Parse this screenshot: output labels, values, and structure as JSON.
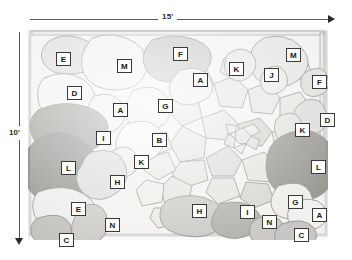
{
  "drawing": {
    "title": "Flagstone patio plan",
    "dimensions": {
      "width_label": "15'",
      "height_label": "10'"
    },
    "colors": {
      "ink": "#3a3a3a",
      "paper": "#ffffff",
      "stone_light": "#f0efed",
      "stone_mid": "#dcdbd7",
      "stone_dark": "#9a9a96",
      "stone_darkest": "#8c8b86",
      "label_fill": "#fdfdfb"
    },
    "plant_labels": [
      {
        "text": "E",
        "x": 56,
        "y": 52
      },
      {
        "text": "M",
        "x": 117,
        "y": 59
      },
      {
        "text": "F",
        "x": 173,
        "y": 47
      },
      {
        "text": "K",
        "x": 229,
        "y": 62
      },
      {
        "text": "J",
        "x": 264,
        "y": 68
      },
      {
        "text": "M",
        "x": 286,
        "y": 48
      },
      {
        "text": "D",
        "x": 67,
        "y": 86
      },
      {
        "text": "A",
        "x": 193,
        "y": 73
      },
      {
        "text": "F",
        "x": 312,
        "y": 75
      },
      {
        "text": "A",
        "x": 113,
        "y": 103
      },
      {
        "text": "G",
        "x": 158,
        "y": 99
      },
      {
        "text": "D",
        "x": 320,
        "y": 113
      },
      {
        "text": "K",
        "x": 295,
        "y": 123
      },
      {
        "text": "I",
        "x": 96,
        "y": 131
      },
      {
        "text": "B",
        "x": 152,
        "y": 133
      },
      {
        "text": "L",
        "x": 61,
        "y": 161
      },
      {
        "text": "K",
        "x": 134,
        "y": 155
      },
      {
        "text": "L",
        "x": 311,
        "y": 160
      },
      {
        "text": "H",
        "x": 110,
        "y": 175
      },
      {
        "text": "E",
        "x": 71,
        "y": 202
      },
      {
        "text": "H",
        "x": 192,
        "y": 204
      },
      {
        "text": "I",
        "x": 240,
        "y": 205
      },
      {
        "text": "G",
        "x": 288,
        "y": 195
      },
      {
        "text": "N",
        "x": 105,
        "y": 218
      },
      {
        "text": "N",
        "x": 262,
        "y": 215
      },
      {
        "text": "A",
        "x": 312,
        "y": 208
      },
      {
        "text": "C",
        "x": 59,
        "y": 233
      },
      {
        "text": "C",
        "x": 294,
        "y": 228
      }
    ]
  }
}
